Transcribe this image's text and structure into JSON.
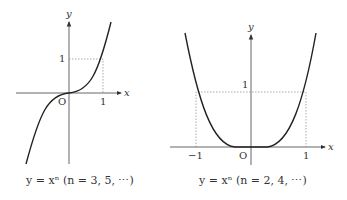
{
  "left": {
    "x_label": "x",
    "y_label": "y",
    "origin_label": "O",
    "tick_x": "1",
    "tick_y": "1",
    "caption": "y = xⁿ (n = 3, 5, ⋯)"
  },
  "right": {
    "x_label": "x",
    "y_label": "y",
    "origin_label": "O",
    "tick_x_neg": "−1",
    "tick_x": "1",
    "tick_y": "1",
    "caption": "y = xⁿ (n = 2, 4, ⋯)"
  }
}
